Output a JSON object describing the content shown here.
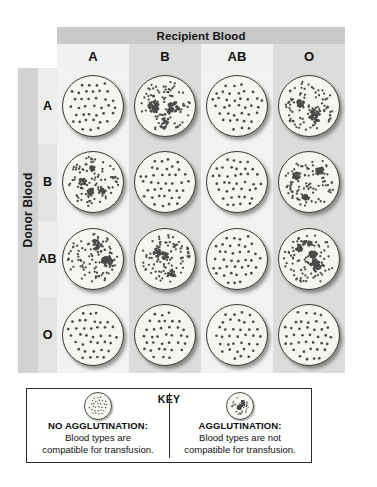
{
  "figure": {
    "title": "Recipient Blood",
    "donor_axis_label": "Donor Blood",
    "recipient_types": [
      "A",
      "B",
      "AB",
      "O"
    ],
    "donor_types": [
      "A",
      "B",
      "AB",
      "O"
    ],
    "colors": {
      "title_band": "#c9c9c9",
      "spine": "#d2d2d2",
      "cell_light": "#f2f2f0",
      "cell_dark": "#dcdcda",
      "dish_fill": "#f7f5ef",
      "dish_rim": "#3a3a38",
      "cell_dot": "#4a4a4a",
      "text": "#111111"
    }
  },
  "matrix": {
    "row_labels": [
      "A",
      "B",
      "AB",
      "O"
    ],
    "col_labels": [
      "A",
      "B",
      "AB",
      "O"
    ],
    "agglutination": [
      [
        false,
        true,
        false,
        true
      ],
      [
        true,
        false,
        false,
        true
      ],
      [
        true,
        true,
        false,
        true
      ],
      [
        false,
        false,
        false,
        false
      ]
    ],
    "cells": [
      {
        "donor": "A",
        "recipient": "A",
        "agglutination": "no"
      },
      {
        "donor": "A",
        "recipient": "B",
        "agglutination": "yes"
      },
      {
        "donor": "A",
        "recipient": "AB",
        "agglutination": "no"
      },
      {
        "donor": "A",
        "recipient": "O",
        "agglutination": "yes"
      },
      {
        "donor": "B",
        "recipient": "A",
        "agglutination": "yes"
      },
      {
        "donor": "B",
        "recipient": "B",
        "agglutination": "no"
      },
      {
        "donor": "B",
        "recipient": "AB",
        "agglutination": "no"
      },
      {
        "donor": "B",
        "recipient": "O",
        "agglutination": "yes"
      },
      {
        "donor": "AB",
        "recipient": "A",
        "agglutination": "yes"
      },
      {
        "donor": "AB",
        "recipient": "B",
        "agglutination": "yes"
      },
      {
        "donor": "AB",
        "recipient": "AB",
        "agglutination": "no"
      },
      {
        "donor": "AB",
        "recipient": "O",
        "agglutination": "yes"
      },
      {
        "donor": "O",
        "recipient": "A",
        "agglutination": "no"
      },
      {
        "donor": "O",
        "recipient": "B",
        "agglutination": "no"
      },
      {
        "donor": "O",
        "recipient": "AB",
        "agglutination": "no"
      },
      {
        "donor": "O",
        "recipient": "O",
        "agglutination": "no"
      }
    ]
  },
  "key": {
    "title": "KEY",
    "no_agglutination": {
      "heading": "NO AGGLUTINATION:",
      "line1": "Blood types are",
      "line2": "compatible for transfusion."
    },
    "agglutination": {
      "heading": "AGGLUTINATION:",
      "line1": "Blood types are not",
      "line2": "compatible for transfusion."
    }
  }
}
